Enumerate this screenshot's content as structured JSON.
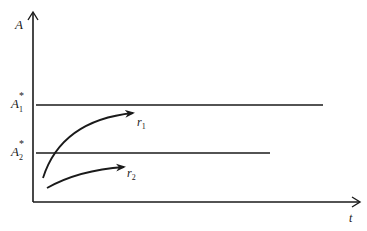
{
  "diagram": {
    "y_axis_label": "A",
    "x_axis_label": "t",
    "levels": [
      {
        "label": "A",
        "sup": "*",
        "sub": "1",
        "y": 105,
        "x_end": 323
      },
      {
        "label": "A",
        "sup": "*",
        "sub": "2",
        "y": 153,
        "x_end": 270
      }
    ],
    "curves": [
      {
        "label": "r",
        "sub": "1"
      },
      {
        "label": "r",
        "sub": "2"
      }
    ],
    "line_color": "#1a1a1a"
  }
}
